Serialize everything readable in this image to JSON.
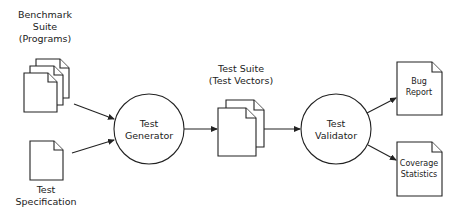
{
  "diagram": {
    "type": "flowchart",
    "nodes": {
      "benchmark_suite": {
        "label_lines": [
          "Benchmark",
          "Suite",
          "(Programs)"
        ],
        "shape": "stacked-documents"
      },
      "test_specification": {
        "label_lines": [
          "Test",
          "Specification"
        ],
        "shape": "document"
      },
      "test_generator": {
        "label_lines": [
          "Test",
          "Generator"
        ],
        "shape": "circle"
      },
      "test_suite": {
        "label_lines": [
          "Test Suite",
          "(Test Vectors)"
        ],
        "shape": "stacked-documents"
      },
      "test_validator": {
        "label_lines": [
          "Test",
          "Validator"
        ],
        "shape": "circle"
      },
      "bug_report": {
        "label_lines": [
          "Bug",
          "Report"
        ],
        "shape": "document"
      },
      "coverage_statistics": {
        "label_lines": [
          "Coverage",
          "Statistics"
        ],
        "shape": "document"
      }
    },
    "edges": [
      {
        "from": "benchmark_suite",
        "to": "test_generator"
      },
      {
        "from": "test_specification",
        "to": "test_generator"
      },
      {
        "from": "test_generator",
        "to": "test_suite"
      },
      {
        "from": "test_suite",
        "to": "test_validator"
      },
      {
        "from": "test_validator",
        "to": "bug_report"
      },
      {
        "from": "test_validator",
        "to": "coverage_statistics"
      }
    ]
  }
}
